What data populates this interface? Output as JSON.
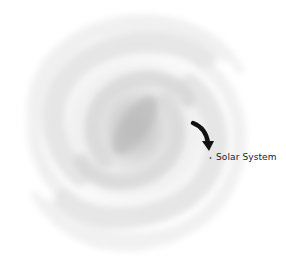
{
  "diagram": {
    "type": "spiral-galaxy-illustration",
    "annotation": {
      "label": "Solar System",
      "marker": "dot",
      "pointer": "curved-arrow-icon"
    },
    "colors": {
      "background": "#ffffff",
      "galaxy_core": "#c8c8c8",
      "galaxy_arms": "#e2e2e2",
      "arrow": "#111111",
      "label_text": "#1a1a1a"
    }
  }
}
